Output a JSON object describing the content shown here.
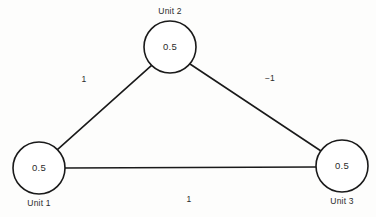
{
  "diagram": {
    "type": "graph",
    "background_color": "#fdfdfc",
    "stroke_color": "#1a1a1a",
    "text_color": "#2b2b2b",
    "nodes": [
      {
        "id": "unit1",
        "label": "Unit 1",
        "value": "0.5",
        "cx": 39,
        "cy": 168,
        "r": 26,
        "label_x": 39,
        "label_y": 204
      },
      {
        "id": "unit2",
        "label": "Unit 2",
        "value": "0.5",
        "cx": 170,
        "cy": 47,
        "r": 26,
        "label_x": 170,
        "label_y": 12
      },
      {
        "id": "unit3",
        "label": "Unit 3",
        "value": "0.5",
        "cx": 342,
        "cy": 166,
        "r": 26,
        "label_x": 342,
        "label_y": 202
      }
    ],
    "edges": [
      {
        "id": "edge-unit1-unit2",
        "from": "unit1",
        "to": "unit2",
        "weight": "1",
        "x1": 57.4,
        "y1": 149.6,
        "x2": 151.6,
        "y2": 65.4,
        "label_x": 84,
        "label_y": 80
      },
      {
        "id": "edge-unit2-unit3",
        "from": "unit2",
        "to": "unit3",
        "weight": "−1",
        "x1": 190.0,
        "y1": 64.0,
        "x2": 321.0,
        "y2": 151.0,
        "label_x": 270,
        "label_y": 79
      },
      {
        "id": "edge-unit1-unit3",
        "from": "unit1",
        "to": "unit3",
        "weight": "1",
        "x1": 65.0,
        "y1": 168.0,
        "x2": 316.0,
        "y2": 167.0,
        "label_x": 189,
        "label_y": 200
      }
    ]
  }
}
